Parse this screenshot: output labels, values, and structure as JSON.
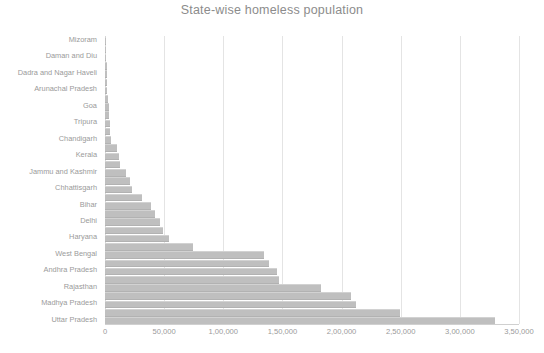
{
  "chart_data": {
    "type": "bar",
    "orientation": "horizontal",
    "title": "State-wise homeless population",
    "xlabel": "",
    "ylabel": "",
    "xlim": [
      0,
      350000
    ],
    "grid": true,
    "legend": false,
    "bar_color": "#bfbfbf",
    "text_color": "#9a9a9a",
    "title_color": "#8c8c8c",
    "xticks": [
      0,
      50000,
      100000,
      150000,
      200000,
      250000,
      300000,
      350000
    ],
    "xticklabels": [
      "0",
      "50,000",
      "1,00,000",
      "1,50,000",
      "2,00,000",
      "2,50,000",
      "3,00,000",
      "3,50,000"
    ],
    "label_every_nth": 2,
    "categories": [
      "Mizoram",
      "Lakshadweep",
      "Daman and Diu",
      "Andaman and Nicobar Islands",
      "Dadra and Nagar Haveli",
      "Sikkim",
      "Arunachal Pradesh",
      "Nagaland",
      "Goa",
      "Manipur",
      "Tripura",
      "Meghalaya",
      "Chandigarh",
      "Puducherry",
      "Kerala",
      "Himachal Pradesh",
      "Jammu and Kashmir",
      "Uttarakhand",
      "Chhattisgarh",
      "Assam",
      "Bihar",
      "Jharkhand",
      "Delhi",
      "Punjab",
      "Haryana",
      "Odisha",
      "West Bengal",
      "Karnataka",
      "Andhra Pradesh",
      "Tamil Nadu",
      "Rajasthan",
      "Gujarat",
      "Madhya Pradesh",
      "Maharashtra",
      "Uttar Pradesh"
    ],
    "values": [
      900,
      1000,
      1200,
      1400,
      1600,
      1800,
      2100,
      2600,
      3100,
      3600,
      4100,
      4600,
      5200,
      10500,
      11500,
      12500,
      17500,
      21000,
      22500,
      31000,
      39000,
      42000,
      46500,
      49000,
      54000,
      74000,
      134000,
      139000,
      145000,
      147000,
      183000,
      208000,
      212000,
      249000,
      330000
    ],
    "value_labels": [
      "900",
      "1,000",
      "1,200",
      "1,400",
      "1,600",
      "1,800",
      "2,100",
      "2,600",
      "3,100",
      "3,600",
      "4,100",
      "4,600",
      "5,200",
      "10,500",
      "11,500",
      "12,500",
      "17,500",
      "21,000",
      "22,500",
      "31,000",
      "39,000",
      "42,000",
      "46,500",
      "49,000",
      "54,000",
      "74,000",
      "1,34,000",
      "1,39,000",
      "1,45,000",
      "1,47,000",
      "1,83,000",
      "2,08,000",
      "2,12,000",
      "2,49,000",
      "3,30,000"
    ],
    "visible_ytick_labels": [
      "Mizoram",
      "Daman and Diu",
      "Dadra and Nagar Haveli",
      "Arunachal Pradesh",
      "Goa",
      "Tripura",
      "Chandigarh",
      "Kerala",
      "Jammu and Kashmir",
      "Chhattisgarh",
      "Bihar",
      "Delhi",
      "Haryana",
      "West Bengal",
      "Andhra Pradesh",
      "Rajasthan",
      "Uttar Pradesh"
    ]
  },
  "bottom_caption": ""
}
